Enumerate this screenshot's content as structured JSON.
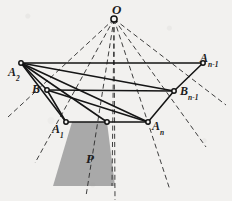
{
  "figure": {
    "title": "",
    "background_color": "#f2f1ef",
    "stroke_color": "#1c1c1c",
    "shaded_color": "#a9a9a9",
    "labels": {
      "apex": {
        "base": "O",
        "sub": "",
        "x": 112,
        "y": 3
      },
      "a2": {
        "base": "A",
        "sub": "2",
        "x": 8,
        "y": 66
      },
      "b": {
        "base": "B",
        "sub": "",
        "x": 32,
        "y": 83
      },
      "a1": {
        "base": "A",
        "sub": "1",
        "x": 52,
        "y": 123
      },
      "an": {
        "base": "A",
        "sub": "n",
        "x": 152,
        "y": 120
      },
      "bn1": {
        "base": "B",
        "sub": "n-1",
        "x": 180,
        "y": 85
      },
      "an1": {
        "base": "A",
        "sub": "n-1",
        "x": 200,
        "y": 52
      },
      "p": {
        "base": "P",
        "sub": "",
        "x": 86,
        "y": 152
      }
    },
    "points": {
      "O": {
        "x": 114,
        "y": 19
      },
      "A2": {
        "x": 21,
        "y": 63
      },
      "B": {
        "x": 47,
        "y": 90
      },
      "A1": {
        "x": 66,
        "y": 122
      },
      "M": {
        "x": 107,
        "y": 122
      },
      "An": {
        "x": 148,
        "y": 122
      },
      "Bn1": {
        "x": 174,
        "y": 91
      },
      "An1": {
        "x": 203,
        "y": 63
      }
    },
    "shaded_region": {
      "name": "P",
      "vertices": [
        [
          72,
          122
        ],
        [
          107,
          122
        ],
        [
          115,
          186
        ],
        [
          53,
          186
        ]
      ]
    },
    "solid_edges": [
      [
        "A2",
        "An1"
      ],
      [
        "A2",
        "B"
      ],
      [
        "B",
        "A1"
      ],
      [
        "A1",
        "M"
      ],
      [
        "M",
        "An"
      ],
      [
        "An",
        "Bn1"
      ],
      [
        "Bn1",
        "An1"
      ],
      [
        "A2",
        "Bn1"
      ],
      [
        "A2",
        "An"
      ],
      [
        "A2",
        "M"
      ],
      [
        "A2",
        "A1"
      ],
      [
        "B",
        "An"
      ],
      [
        "B",
        "Bn1"
      ]
    ],
    "dashed_rays": [
      [
        "O",
        8,
        117
      ],
      [
        "O",
        35,
        163
      ],
      [
        "O",
        86,
        196
      ],
      [
        "O",
        115,
        200
      ],
      [
        "O",
        170,
        190
      ],
      [
        "O",
        206,
        147
      ],
      [
        "O",
        226,
        105
      ]
    ],
    "dashed_center_line": {
      "from": "O",
      "to": [
        112,
        186
      ]
    }
  }
}
